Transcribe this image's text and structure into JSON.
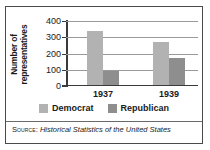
{
  "chart_data": {
    "type": "bar",
    "title": "",
    "xlabel": "",
    "ylabel": "Number of representatives",
    "categories": [
      "1937",
      "1939"
    ],
    "series": [
      {
        "name": "Democrat",
        "color": "#b2b2b2",
        "values": [
          331,
          262
        ]
      },
      {
        "name": "Republican",
        "color": "#8e8e8e",
        "values": [
          89,
          169
        ]
      }
    ],
    "ylim": [
      0,
      400
    ],
    "yticks": [
      0,
      100,
      200,
      300,
      400
    ],
    "ytick_labels": [
      "0",
      "100",
      "200",
      "300",
      "400"
    ],
    "grid": true,
    "legend_position": "bottom"
  },
  "source": {
    "prefix": "Source:",
    "title": "Historical Statistics of the United States"
  }
}
